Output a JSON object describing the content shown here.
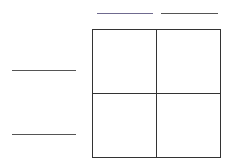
{
  "diagram": {
    "type": "punnett-square",
    "top_alleles": [
      "",
      ""
    ],
    "left_alleles": [
      "",
      ""
    ],
    "cells": [
      "",
      "",
      "",
      ""
    ],
    "colors": {
      "line": "#333333",
      "blank_line": "#555555",
      "top_left_blank_tint": "#7a6a9a"
    }
  }
}
